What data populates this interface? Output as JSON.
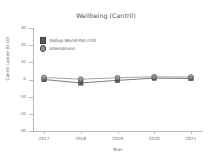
{
  "chart_data": {
    "type": "line",
    "title": "Wellbeing (Cantril)",
    "xlabel": "Year",
    "ylabel": "Cantril Ladder (0-10)",
    "x": [
      2017,
      2018,
      2019,
      2020,
      2021
    ],
    "categories": [
      "2017",
      "2018",
      "2019",
      "2020",
      "2021"
    ],
    "series": [
      {
        "name": "Gallup World Poll (US)",
        "marker": "square",
        "color": "#595959",
        "values": [
          0.0,
          -2.0,
          -0.5,
          0.8,
          0.6
        ]
      },
      {
        "name": "Internations",
        "marker": "circle",
        "color": "#8f8f8f",
        "values": [
          1.2,
          0.2,
          1.0,
          1.6,
          1.4
        ]
      }
    ],
    "ylim": [
      -30,
      30
    ],
    "xlim": [
      2016.7,
      2021.3
    ],
    "yticks": [
      -30,
      -20,
      -10,
      0,
      10,
      20,
      30
    ],
    "ytick_labels": [
      "-30",
      "-20",
      "-10",
      "0",
      "10",
      "20",
      "30"
    ],
    "grid": false,
    "legend_position": "upper left"
  },
  "legend": {
    "entries": [
      {
        "label": "Gallup World Poll (US)",
        "marker": "square"
      },
      {
        "label": "Internations",
        "marker": "circle"
      }
    ]
  },
  "colors": {
    "series_1": "#595959",
    "series_2": "#8f8f8f",
    "axis": "#b9b9b9",
    "text": "#5f5f5f",
    "background": "#ffffff"
  }
}
